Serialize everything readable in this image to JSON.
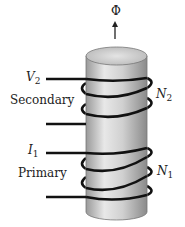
{
  "diagram": {
    "flux_label": "Φ",
    "secondary": {
      "label": "Secondary",
      "voltage_symbol": "V",
      "voltage_sub": "2",
      "turns_symbol": "N",
      "turns_sub": "2"
    },
    "primary": {
      "label": "Primary",
      "current_symbol": "I",
      "current_sub": "1",
      "turns_symbol": "N",
      "turns_sub": "1"
    }
  }
}
